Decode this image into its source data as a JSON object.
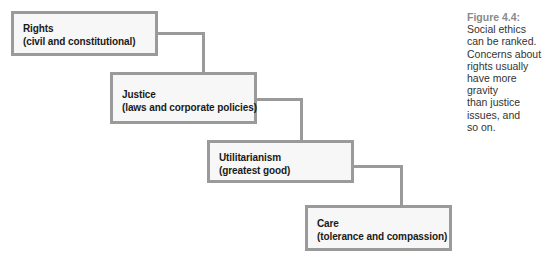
{
  "diagram": {
    "type": "staircase-hierarchy",
    "boxes": [
      {
        "title": "Rights",
        "subtitle": "(civil and constitutional)"
      },
      {
        "title": "Justice",
        "subtitle": "(laws and corporate policies)"
      },
      {
        "title": "Utilitarianism",
        "subtitle": "(greatest good)"
      },
      {
        "title": "Care",
        "subtitle": "(tolerance and compassion)"
      }
    ],
    "colors": {
      "border": "#9a9a9a",
      "fill": "#f7f7f7",
      "text": "#1a1a1a"
    }
  },
  "caption": {
    "figure_label": "Figure 4.4:",
    "lines": [
      "Social ethics",
      "can be ranked.",
      "Concerns about",
      "rights usually",
      "have more gravity",
      "than justice",
      "issues, and",
      "so on."
    ]
  }
}
